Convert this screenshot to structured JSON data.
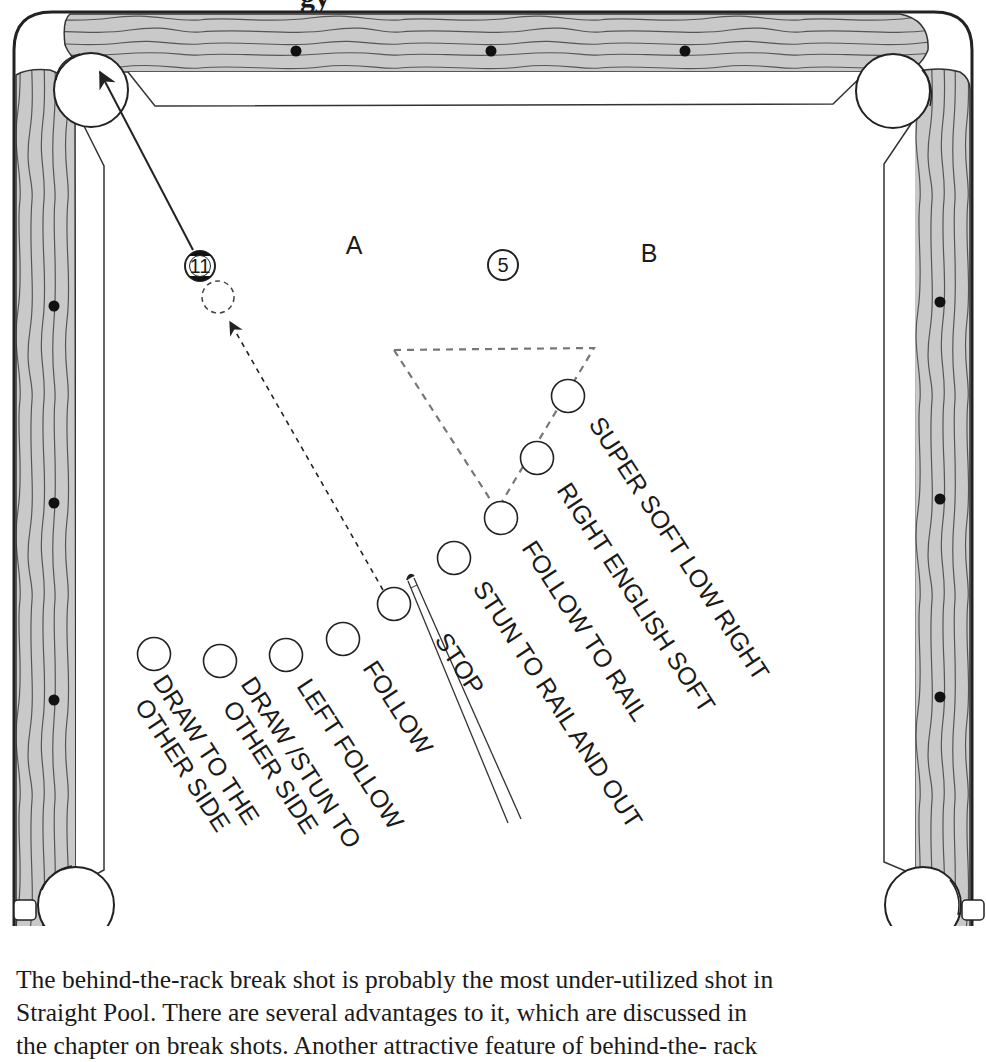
{
  "heading_partial": "gy",
  "table": {
    "rail_color": "#c8c8c8",
    "felt_color": "#ffffff",
    "line_color": "#222222",
    "diamonds": {
      "top": [
        {
          "x": 296,
          "y": 51
        },
        {
          "x": 491,
          "y": 51
        },
        {
          "x": 685,
          "y": 51
        }
      ],
      "left": [
        {
          "x": 54,
          "y": 306
        },
        {
          "x": 54,
          "y": 503
        },
        {
          "x": 54,
          "y": 700
        }
      ],
      "right": [
        {
          "x": 940,
          "y": 302
        },
        {
          "x": 940,
          "y": 499
        },
        {
          "x": 940,
          "y": 697
        }
      ]
    }
  },
  "zones": [
    {
      "id": "A",
      "label": "A",
      "x": 354,
      "y": 254
    },
    {
      "id": "B",
      "label": "B",
      "x": 649,
      "y": 262
    }
  ],
  "object_balls": [
    {
      "id": "ball-11",
      "number": "11",
      "x": 200,
      "y": 266,
      "striped": true
    },
    {
      "id": "ball-5",
      "number": "5",
      "x": 503,
      "y": 265,
      "striped": false
    }
  ],
  "ghost_ball": {
    "x": 218,
    "y": 297
  },
  "cue_ball_positions": [
    {
      "label": "SUPER SOFT LOW RIGHT",
      "x": 568,
      "y": 396
    },
    {
      "label": "RIGHT ENGLISH SOFT",
      "x": 537,
      "y": 458
    },
    {
      "label": "FOLLOW TO RAIL",
      "x": 501,
      "y": 518
    },
    {
      "label": "STUN TO RAIL AND OUT",
      "x": 454,
      "y": 558
    },
    {
      "label": "STOP",
      "x": 394,
      "y": 604
    },
    {
      "label": "FOLLOW",
      "x": 343,
      "y": 639
    },
    {
      "label": "LEFT FOLLOW",
      "x": 286,
      "y": 655
    },
    {
      "label": "DRAW /STUN TO|OTHER SIDE",
      "x": 220,
      "y": 661
    },
    {
      "label": "DRAW TO THE|OTHER SIDE",
      "x": 154,
      "y": 654
    }
  ],
  "labels": [
    {
      "lines": [
        "SUPER SOFT LOW RIGHT"
      ],
      "x": 588,
      "y": 424
    },
    {
      "lines": [
        "RIGHT ENGLISH SOFT"
      ],
      "x": 556,
      "y": 490
    },
    {
      "lines": [
        "FOLLOW TO RAIL"
      ],
      "x": 521,
      "y": 548
    },
    {
      "lines": [
        "STUN TO RAIL AND OUT"
      ],
      "x": 472,
      "y": 588
    },
    {
      "lines": [
        "STOP"
      ],
      "x": 434,
      "y": 640
    },
    {
      "lines": [
        "FOLLOW"
      ],
      "x": 362,
      "y": 668
    },
    {
      "lines": [
        "LEFT FOLLOW"
      ],
      "x": 296,
      "y": 686
    },
    {
      "lines": [
        "DRAW /STUN TO",
        "OTHER SIDE"
      ],
      "x": 240,
      "y": 684
    },
    {
      "lines": [
        "DRAW TO THE",
        "OTHER SIDE"
      ],
      "x": 152,
      "y": 682
    }
  ],
  "caption": {
    "lines": [
      "The behind-the-rack break shot is probably the most under-utilized shot in",
      "Straight Pool.  There are several advantages to it, which are discussed in",
      "the chapter on break shots.  Another attractive feature of behind-the- rack"
    ]
  }
}
